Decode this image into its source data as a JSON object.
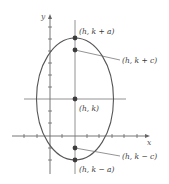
{
  "diagram": {
    "type": "ellipse-vertical-major-axis",
    "axes": {
      "x_label": "x",
      "y_label": "y"
    },
    "colors": {
      "stroke": "#555555",
      "axis": "#666666",
      "point": "#3c3c3c",
      "text": "#3a3a3a"
    },
    "points": {
      "top_vertex": {
        "label": "(h, k + a)"
      },
      "top_focus": {
        "label": "(h, k + c)"
      },
      "center": {
        "label": "(h, k)"
      },
      "bottom_focus": {
        "label": "(h, k − c)"
      },
      "bottom_vertex": {
        "label": "(h, k − a)"
      }
    }
  }
}
